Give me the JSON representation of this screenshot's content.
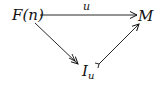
{
  "nodes": {
    "source": "F(n)",
    "target": "M",
    "image_base": "I",
    "image_sub": "u"
  },
  "edges": {
    "top_label": "u"
  },
  "colors": {
    "ink": "#111111"
  }
}
